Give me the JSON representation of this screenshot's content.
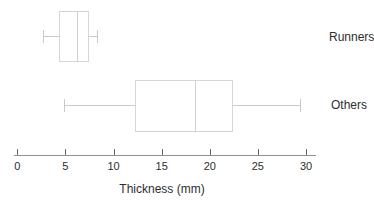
{
  "figure": {
    "background": "#ffffff"
  },
  "colors": {
    "box_stroke": "#d6d6d6",
    "median_stroke": "#d0d0d0",
    "whisker_stroke": "#c9c9c9",
    "axis_line": "#8f8f8f",
    "tick_mark": "#6b6b6b",
    "text": "#2e2e2e"
  },
  "chart_data": {
    "type": "boxplot",
    "orientation": "horizontal",
    "title": "",
    "xlabel": "Thickness (mm)",
    "xlim": [
      0,
      30
    ],
    "xticks": [
      0,
      5,
      10,
      15,
      20,
      25,
      30
    ],
    "grid": false,
    "legend": "none",
    "categories": [
      "Runners",
      "Others"
    ],
    "series": [
      {
        "name": "Runners",
        "min": 2.7,
        "q1": 4.3,
        "median": 6.2,
        "q3": 7.4,
        "max": 8.3
      },
      {
        "name": "Others",
        "min": 4.9,
        "q1": 12.2,
        "median": 18.5,
        "q3": 22.4,
        "max": 29.4
      }
    ]
  }
}
